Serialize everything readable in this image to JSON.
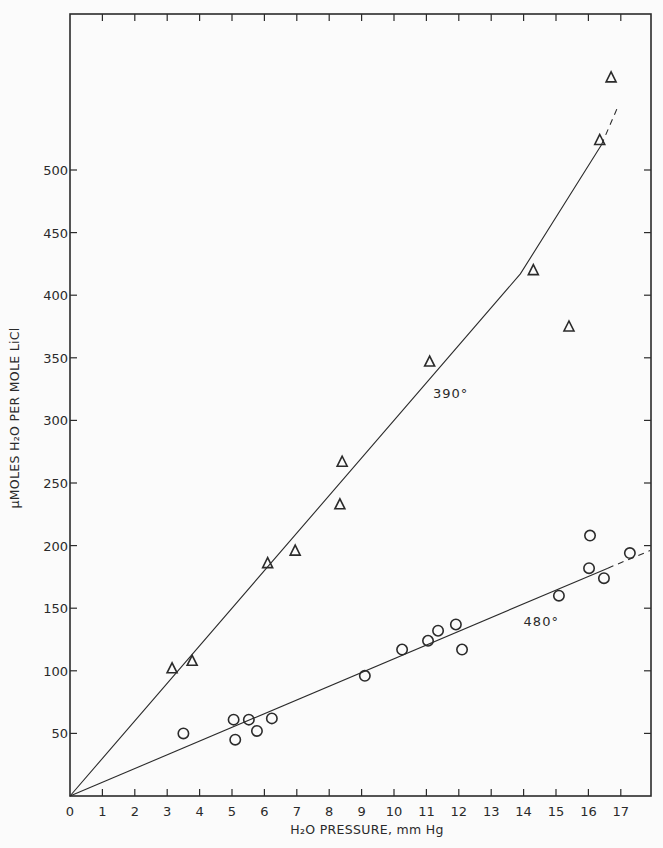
{
  "chart_data": {
    "type": "scatter",
    "title": "",
    "xlabel": "H₂O PRESSURE, mm Hg",
    "ylabel": "μMOLES H₂O PER MOLE LiCl",
    "xlim": [
      0,
      18
    ],
    "ylim": [
      0,
      620
    ],
    "x_ticks": [
      0,
      1,
      2,
      3,
      4,
      5,
      6,
      7,
      8,
      9,
      10,
      11,
      12,
      13,
      14,
      15,
      16,
      17
    ],
    "y_ticks": [
      50,
      100,
      150,
      200,
      250,
      300,
      350,
      400,
      450,
      500
    ],
    "y_tick_labels": [
      "50",
      "100",
      "150",
      "200",
      "250",
      "300",
      "350",
      "400",
      "450",
      "500"
    ],
    "grid": false,
    "legend": "none (inline curve labels)",
    "series": [
      {
        "name": "390°",
        "marker": "triangle",
        "points": [
          [
            3.15,
            102
          ],
          [
            3.77,
            108
          ],
          [
            6.1,
            186
          ],
          [
            6.95,
            196
          ],
          [
            8.33,
            233
          ],
          [
            8.4,
            267
          ],
          [
            11.1,
            347
          ],
          [
            14.3,
            420
          ],
          [
            15.4,
            375
          ],
          [
            16.35,
            524
          ],
          [
            16.7,
            574
          ]
        ],
        "fit_line": [
          [
            0,
            0
          ],
          [
            13.9,
            417
          ],
          [
            16.4,
            520
          ]
        ],
        "fit_line_dashed": [
          [
            16.4,
            520
          ],
          [
            16.9,
            550
          ]
        ],
        "label_pos": [
          11.2,
          318
        ]
      },
      {
        "name": "480°",
        "marker": "circle",
        "points": [
          [
            3.5,
            50
          ],
          [
            5.05,
            61
          ],
          [
            5.1,
            45
          ],
          [
            5.52,
            61
          ],
          [
            5.77,
            52
          ],
          [
            6.23,
            62
          ],
          [
            9.1,
            96
          ],
          [
            10.25,
            117
          ],
          [
            11.05,
            124
          ],
          [
            11.36,
            132
          ],
          [
            11.91,
            137
          ],
          [
            12.1,
            117
          ],
          [
            15.09,
            160
          ],
          [
            16.02,
            182
          ],
          [
            16.05,
            208
          ],
          [
            16.48,
            174
          ],
          [
            17.28,
            194
          ]
        ],
        "fit_line": [
          [
            0,
            0
          ],
          [
            16.6,
            182
          ]
        ],
        "fit_line_dashed": [
          [
            16.6,
            182
          ],
          [
            17.9,
            196
          ]
        ],
        "label_pos": [
          14.0,
          136
        ]
      }
    ]
  },
  "annotations": {
    "curve_390": "390°",
    "curve_480": "480°"
  },
  "axes": {
    "x_title": "H₂O PRESSURE, mm Hg",
    "y_title": "μMOLES H₂O PER MOLE LiCl"
  }
}
